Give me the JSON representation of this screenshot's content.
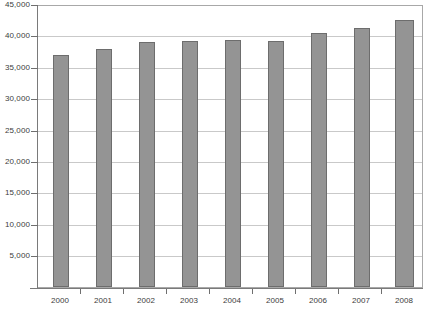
{
  "chart_data": {
    "type": "bar",
    "title": "",
    "subtitle": "",
    "xlabel": "",
    "ylabel": "",
    "categories": [
      "2000",
      "2001",
      "2002",
      "2003",
      "2004",
      "2005",
      "2006",
      "2007",
      "2008"
    ],
    "values": [
      37200,
      38100,
      39200,
      39400,
      39500,
      39400,
      40600,
      41500,
      42700
    ],
    "series": [
      {
        "name": "",
        "values": [
          37200,
          38100,
          39200,
          39400,
          39500,
          39400,
          40600,
          41500,
          42700
        ]
      }
    ],
    "ylim": [
      0,
      45000
    ],
    "ytick_values": [
      0,
      5000,
      10000,
      15000,
      20000,
      25000,
      30000,
      35000,
      40000,
      45000
    ],
    "ytick_labels": [
      "",
      "5,000",
      "10,000",
      "15,000",
      "20,000",
      "25,000",
      "30,000",
      "35,000",
      "40,000",
      "45,000"
    ],
    "grid": true,
    "grid_axis": "y",
    "legend": false,
    "legend_position": "none",
    "bar_color": "#949494",
    "bar_border_color": "#6d6d6d",
    "gridline_color": "#c9c9c9",
    "axis_color": "#7a7a7a",
    "plot_background": "#ffffff",
    "annotations": []
  }
}
